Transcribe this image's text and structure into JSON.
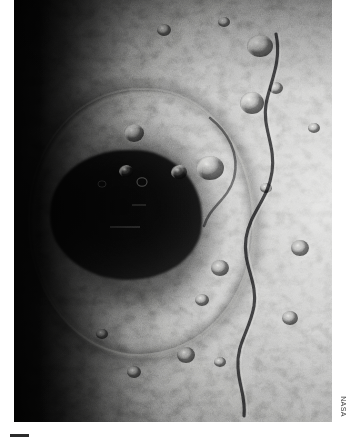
{
  "figure": {
    "kind": "photograph",
    "palette": {
      "page_background": "#ffffff",
      "terrain_highlight": "#c9c9c7",
      "terrain_midtone": "#858583",
      "terrain_shadow": "#1d1d1c",
      "basin_floor": "#0a0a0a",
      "credit_text": "#3a3a3a",
      "scale_bar": "#2b2b2b"
    },
    "plate": {
      "left": 14,
      "top": 0,
      "width": 318,
      "height": 422
    }
  },
  "credit": {
    "label": "NASA",
    "orientation": "vertical",
    "rotation_degrees": 90
  },
  "scale_bar": {
    "label": ""
  },
  "features": {
    "basin": {
      "name": "impact basin floor",
      "center_x_pct": 34,
      "center_y_pct": 50
    },
    "rim": {
      "name": "basin rim ring"
    },
    "scarp": {
      "name": "sinuous lobate scarp"
    },
    "terminator": {
      "name": "terminator shadow band",
      "side": "left"
    }
  }
}
